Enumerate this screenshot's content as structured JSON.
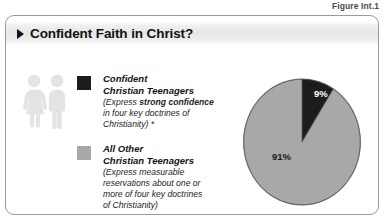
{
  "figure": {
    "label": "Figure Int.1"
  },
  "card": {
    "header": {
      "title": "Confident Faith in Christ?",
      "arrow_icon": "triangle-right-icon"
    },
    "people_icon": "two-people-icon"
  },
  "legend": [
    {
      "swatch_color": "#1c1c1c",
      "title_line_1": "Confident",
      "title_line_2": "Christian Teenagers",
      "desc_prefix": "(Express ",
      "desc_bold": "strong confidence",
      "desc_suffix_line_1": "",
      "desc_line_2": "in four key doctrines of",
      "desc_line_3": "Christianity) *"
    },
    {
      "swatch_color": "#a8a8a8",
      "title_line_1": "All Other",
      "title_line_2": "Christian Teenagers",
      "desc_line_1": "(Express measurable",
      "desc_line_2": "reservations about one or",
      "desc_line_3": "more of four key doctrines",
      "desc_line_4": "of Christianity)"
    }
  ],
  "chart_data": {
    "type": "pie",
    "title": "Confident Faith in Christ?",
    "labels": [
      "Confident Christian Teenagers",
      "All Other Christian Teenagers"
    ],
    "values": [
      9,
      91
    ],
    "value_labels": [
      "9%",
      "91%"
    ],
    "colors": [
      "#1c1c1c",
      "#a8a8a8"
    ],
    "units": "percent",
    "start_angle_deg": 0,
    "direction": "clockwise",
    "legend_position": "left"
  }
}
